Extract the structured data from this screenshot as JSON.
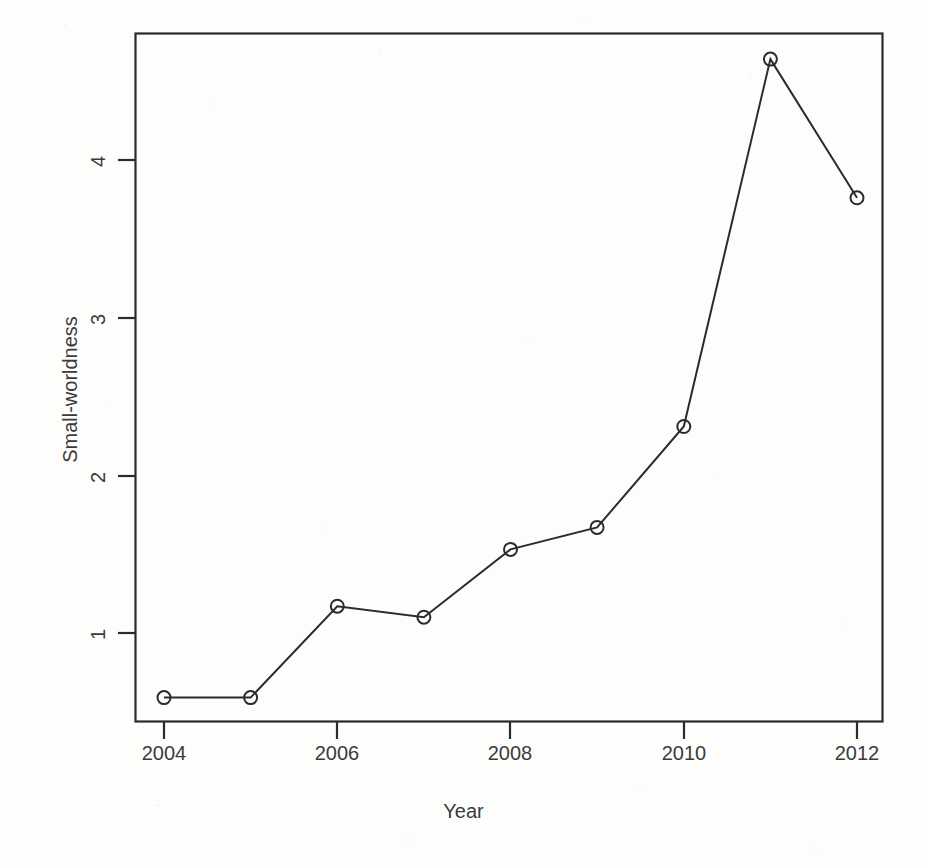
{
  "chart_data": {
    "type": "line",
    "title": "",
    "xlabel": "Year",
    "ylabel": "Small-worldness",
    "x": [
      2004,
      2005,
      2006,
      2007,
      2008,
      2009,
      2010,
      2011,
      2012
    ],
    "values": [
      0.59,
      0.59,
      1.17,
      1.1,
      1.53,
      1.67,
      2.31,
      4.64,
      3.76
    ],
    "series": [
      {
        "name": "Small-worldness",
        "values": [
          0.59,
          0.59,
          1.17,
          1.1,
          1.53,
          1.67,
          2.31,
          4.64,
          3.76
        ]
      }
    ],
    "xlim": [
      2003.5,
      2012.6
    ],
    "ylim": [
      0.5,
      4.86
    ],
    "xticks": [
      2004,
      2006,
      2008,
      2010,
      2012
    ],
    "xtick_labels": [
      "2004",
      "2006",
      "2008",
      "2010",
      "2012"
    ],
    "yticks": [
      1,
      2,
      3,
      4
    ],
    "ytick_labels": [
      "1",
      "2",
      "3",
      "4"
    ],
    "grid": false,
    "legend": false,
    "legend_position": "none",
    "marker": "open-circle",
    "line_color": "#2b2b2b",
    "marker_color": "#2b2b2b",
    "background_color": "#ffffff",
    "frame": true
  },
  "axes": {
    "x_title": "Year",
    "y_title": "Small-worldness"
  }
}
